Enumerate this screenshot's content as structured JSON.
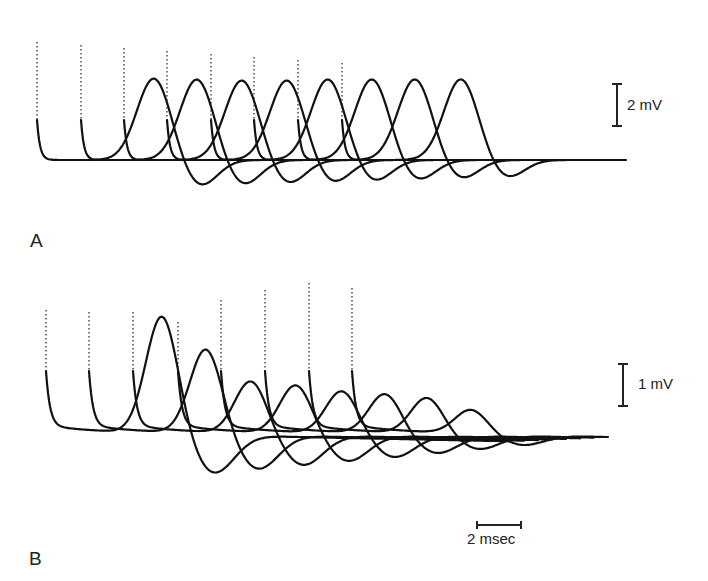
{
  "figure": {
    "panels": [
      {
        "label": "A",
        "scale_bar_label": "2 mV"
      },
      {
        "label": "B",
        "scale_bar_label": "1 mV"
      }
    ],
    "time_scale_label": "2 msec"
  },
  "colors": {
    "trace": "#111111",
    "background": "#ffffff"
  },
  "chart_data": [
    {
      "type": "line",
      "title": "A",
      "description": "Eight superimposed evoked responses, each preceded by a stimulus artifact, with progressively increasing latency",
      "vertical_scale": "2 mV",
      "time_scale": "2 msec",
      "grid": false,
      "series": [
        {
          "name": "response 1",
          "stimulus_x_px": 37,
          "peak_x_px": 154,
          "peak_y_px": 78
        },
        {
          "name": "response 2",
          "stimulus_x_px": 81,
          "peak_x_px": 197,
          "peak_y_px": 79
        },
        {
          "name": "response 3",
          "stimulus_x_px": 124,
          "peak_x_px": 242,
          "peak_y_px": 80
        },
        {
          "name": "response 4",
          "stimulus_x_px": 167,
          "peak_x_px": 287,
          "peak_y_px": 80
        },
        {
          "name": "response 5",
          "stimulus_x_px": 211,
          "peak_x_px": 328,
          "peak_y_px": 79
        },
        {
          "name": "response 6",
          "stimulus_x_px": 254,
          "peak_x_px": 372,
          "peak_y_px": 79
        },
        {
          "name": "response 7",
          "stimulus_x_px": 298,
          "peak_x_px": 415,
          "peak_y_px": 79
        },
        {
          "name": "response 8",
          "stimulus_x_px": 342,
          "peak_x_px": 461,
          "peak_y_px": 79
        }
      ],
      "baseline_y_px": 160
    },
    {
      "type": "line",
      "title": "B",
      "description": "Eight superimposed evoked responses with decreasing amplitude at increasing latency",
      "vertical_scale": "1 mV",
      "time_scale": "2 msec",
      "grid": false,
      "series": [
        {
          "name": "response 1",
          "stimulus_x_px": 46,
          "peak_x_px": 162,
          "peak_y_px": 314
        },
        {
          "name": "response 2",
          "stimulus_x_px": 89,
          "peak_x_px": 206,
          "peak_y_px": 347
        },
        {
          "name": "response 3",
          "stimulus_x_px": 133,
          "peak_x_px": 251,
          "peak_y_px": 379
        },
        {
          "name": "response 4",
          "stimulus_x_px": 178,
          "peak_x_px": 296,
          "peak_y_px": 383
        },
        {
          "name": "response 5",
          "stimulus_x_px": 221,
          "peak_x_px": 342,
          "peak_y_px": 389
        },
        {
          "name": "response 6",
          "stimulus_x_px": 265,
          "peak_x_px": 385,
          "peak_y_px": 392
        },
        {
          "name": "response 7",
          "stimulus_x_px": 309,
          "peak_x_px": 427,
          "peak_y_px": 396
        },
        {
          "name": "response 8",
          "stimulus_x_px": 352,
          "peak_x_px": 471,
          "peak_y_px": 408
        }
      ],
      "baseline_y_px": 432
    }
  ]
}
